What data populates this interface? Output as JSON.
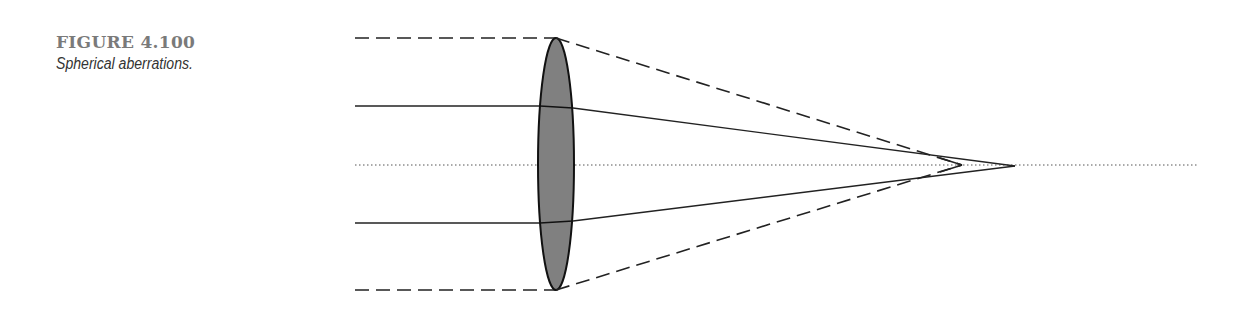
{
  "caption": {
    "figure_number": "FIGURE 4.100",
    "title": "Spherical aberrations."
  },
  "diagram": {
    "lens": {
      "cx": 556,
      "cy": 164,
      "rx": 18,
      "ry": 126,
      "fill": "#808080"
    },
    "optical_axis": {
      "y": 165,
      "x1": 355,
      "x2": 1198
    },
    "rays": [
      {
        "type": "marginal",
        "style": "dashed",
        "y_in": 38,
        "x_start": 355,
        "focus_x": 962
      },
      {
        "type": "paraxial",
        "style": "solid",
        "y_in": 106,
        "x_start": 355,
        "focus_x": 1015
      },
      {
        "type": "paraxial",
        "style": "solid",
        "y_in": 223,
        "x_start": 355,
        "focus_x": 1015
      },
      {
        "type": "marginal",
        "style": "dashed",
        "y_in": 290,
        "x_start": 355,
        "focus_x": 962
      }
    ]
  }
}
